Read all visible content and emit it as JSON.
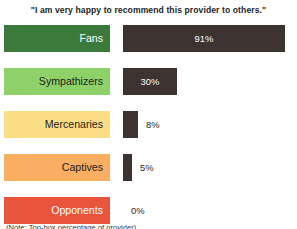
{
  "chart_data": {
    "type": "bar",
    "title": "\"I am very happy to recommend this provider to others.\"",
    "xlabel": "",
    "ylabel": "",
    "xlim": [
      0,
      100
    ],
    "grid": false,
    "legend": "none",
    "orientation": "horizontal",
    "bar_color": "#3d3330",
    "categories": [
      "Fans",
      "Sympathizers",
      "Mercenaries",
      "Captives",
      "Opponents"
    ],
    "values": [
      91,
      30,
      8,
      5,
      0
    ],
    "value_labels": [
      "91%",
      "30%",
      "8%",
      "5%",
      "0%"
    ],
    "category_colors": [
      "#3b7a3b",
      "#8dd168",
      "#fbdd85",
      "#f9ae62",
      "#e8543c"
    ],
    "category_text_colors": [
      "#ffffff",
      "#1d1d1b",
      "#1d1d1b",
      "#1d1d1b",
      "#ffffff"
    ],
    "value_label_placement": [
      "inside",
      "inside",
      "outside",
      "outside",
      "outside"
    ]
  },
  "rows": [
    {
      "label": "Fans",
      "value_label": "91%",
      "value": 91,
      "plate_color": "#3b7a3b",
      "label_color": "#ffffff",
      "bar_width_px": 162,
      "value_inside": true
    },
    {
      "label": "Sympathizers",
      "value_label": "30%",
      "value": 30,
      "plate_color": "#8dd168",
      "label_color": "#1d1d1b",
      "bar_width_px": 54,
      "value_inside": true
    },
    {
      "label": "Mercenaries",
      "value_label": "8%",
      "value": 8,
      "plate_color": "#fbdd85",
      "label_color": "#1d1d1b",
      "bar_width_px": 15,
      "value_inside": false
    },
    {
      "label": "Captives",
      "value_label": "5%",
      "value": 5,
      "plate_color": "#f9ae62",
      "label_color": "#1d1d1b",
      "bar_width_px": 9,
      "value_inside": false
    },
    {
      "label": "Opponents",
      "value_label": "0%",
      "value": 0,
      "plate_color": "#e8543c",
      "label_color": "#ffffff",
      "bar_width_px": 0,
      "value_inside": false
    }
  ],
  "footnote": {
    "text": "(Note: Top-box percentage of provider)"
  }
}
